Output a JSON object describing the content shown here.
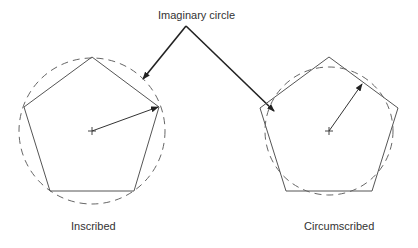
{
  "diagram": {
    "title_label": "Imaginary circle",
    "left": {
      "caption": "Inscribed"
    },
    "right": {
      "caption": "Circumscribed"
    },
    "colors": {
      "line": "#555555",
      "arrow": "#222222",
      "dashed_circle": "#666666",
      "text": "#333333",
      "background": "#ffffff"
    }
  }
}
